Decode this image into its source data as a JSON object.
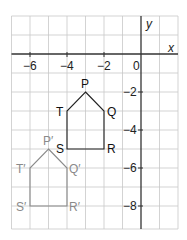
{
  "axes": {
    "x_label": "x",
    "y_label": "y",
    "x_ticks": [
      {
        "value": -6,
        "label": "−6"
      },
      {
        "value": -4,
        "label": "−4"
      },
      {
        "value": -2,
        "label": "−2"
      },
      {
        "value": 0,
        "label": "0"
      }
    ],
    "y_ticks": [
      {
        "value": -2,
        "label": "−2"
      },
      {
        "value": -4,
        "label": "−4"
      },
      {
        "value": -6,
        "label": "−6"
      },
      {
        "value": -8,
        "label": "−8"
      }
    ],
    "x_range": [
      -7,
      2
    ],
    "y_range": [
      -9.2,
      2
    ]
  },
  "shapes": {
    "original": {
      "color": "#222222",
      "vertices": [
        {
          "name": "P",
          "x": -3,
          "y": -2
        },
        {
          "name": "Q",
          "x": -2,
          "y": -3
        },
        {
          "name": "R",
          "x": -2,
          "y": -5
        },
        {
          "name": "S",
          "x": -4,
          "y": -5
        },
        {
          "name": "T",
          "x": -4,
          "y": -3
        }
      ]
    },
    "image": {
      "color": "#8a8a8a",
      "vertices": [
        {
          "name": "P′",
          "x": -5,
          "y": -5
        },
        {
          "name": "Q′",
          "x": -4,
          "y": -6
        },
        {
          "name": "R′",
          "x": -4,
          "y": -8
        },
        {
          "name": "S′",
          "x": -6,
          "y": -8
        },
        {
          "name": "T′",
          "x": -6,
          "y": -6
        }
      ]
    }
  }
}
